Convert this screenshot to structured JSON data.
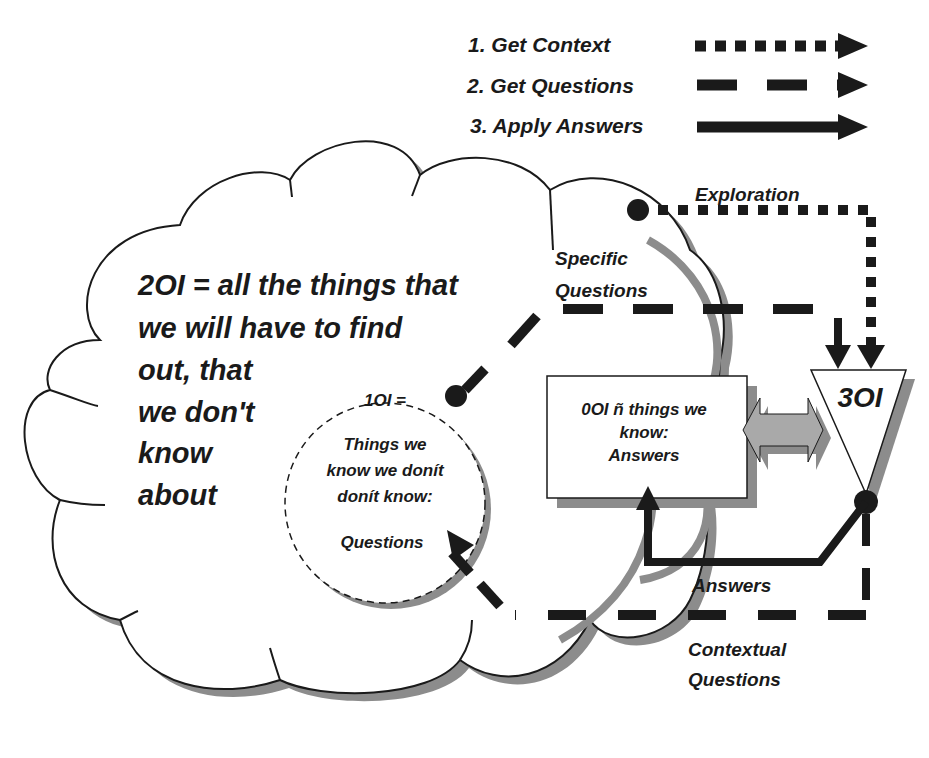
{
  "legend": {
    "items": [
      {
        "label": "1. Get Context",
        "style": "dotted"
      },
      {
        "label": "2. Get Questions",
        "style": "dashed"
      },
      {
        "label": "3. Apply Answers",
        "style": "solid"
      }
    ]
  },
  "cloud": {
    "title_lines": [
      "2OI = all the things that",
      "we will have to find",
      "out, that",
      "we don't",
      "know",
      "about"
    ]
  },
  "circle_1oi": {
    "heading": "1OI =",
    "lines": [
      "Things we",
      "know we donít",
      "donít know:"
    ],
    "footer": "Questions"
  },
  "box_0oi": {
    "lines": [
      "0OI ñ things we",
      "know:",
      "Answers"
    ]
  },
  "triangle_3oi": {
    "label": "3OI"
  },
  "labels": {
    "exploration": "Exploration",
    "specific_questions": [
      "Specific",
      "Questions"
    ],
    "answers": "Answers",
    "contextual_questions": [
      "Contextual",
      "Questions"
    ]
  },
  "colors": {
    "ink": "#1a1a1a",
    "shadow": "#8c8c8c",
    "arrow_fill": "#a9a9a9",
    "background": "#ffffff"
  }
}
